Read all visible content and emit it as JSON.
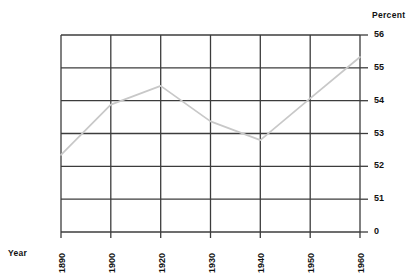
{
  "chart_data": {
    "type": "line",
    "title": "",
    "xlabel": "Year",
    "ylabel": "Percent",
    "x": [
      1890,
      1900,
      1920,
      1930,
      1940,
      1950,
      1960
    ],
    "categories": [
      "1890",
      "1900",
      "1920",
      "1930",
      "1940",
      "1950",
      "1960"
    ],
    "values": [
      52.35,
      53.88,
      54.45,
      53.37,
      52.8,
      54.07,
      55.33
    ],
    "series": [
      {
        "name": "Percent",
        "values": [
          52.35,
          53.88,
          54.45,
          53.37,
          52.8,
          54.07,
          55.33
        ]
      }
    ],
    "ylim": [
      50.9,
      56.1
    ],
    "yticks": [
      56,
      55,
      54,
      53,
      52,
      51
    ],
    "ytick_labels": [
      "56",
      "55",
      "54",
      "53",
      "52",
      "51"
    ],
    "baseline_label": "0",
    "axis_break": true,
    "grid": true,
    "legend": false,
    "line_color": "#c8c8c8",
    "grid_color": "#3c3c3c",
    "background_color": "#ffffff"
  },
  "labels": {
    "percent": "Percent",
    "year": "Year"
  },
  "yaxis": {
    "ticks": [
      {
        "label": "56"
      },
      {
        "label": "55"
      },
      {
        "label": "54"
      },
      {
        "label": "53"
      },
      {
        "label": "52"
      },
      {
        "label": "51"
      },
      {
        "label": "0"
      }
    ]
  },
  "xaxis": {
    "ticks": [
      {
        "label": "1890"
      },
      {
        "label": "1900"
      },
      {
        "label": "1920"
      },
      {
        "label": "1930"
      },
      {
        "label": "1940"
      },
      {
        "label": "1950"
      },
      {
        "label": "1960"
      }
    ]
  }
}
